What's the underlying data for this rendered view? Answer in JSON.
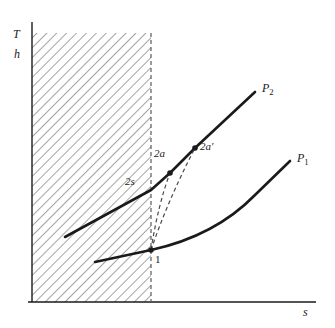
{
  "figure": {
    "title_visible": false,
    "background_color": "#ffffff",
    "line_color": "#1a1a1a",
    "hatch_color": "#555555",
    "dashed_color": "#666666"
  },
  "axes": {
    "y_label_top": "T",
    "y_label_bottom": "h",
    "x_label": "s",
    "x_axis": {
      "x_start": 28,
      "x_end": 316,
      "y": 302
    },
    "y_axis": {
      "x": 32,
      "y_start": 22,
      "y_end": 302
    }
  },
  "saturation_boundary": {
    "name": "vertical-dashed-boundary",
    "x": 151,
    "y_top": 33,
    "y_bottom": 302
  },
  "hatched_region": {
    "name": "two-phase-hatched-region",
    "x": 32,
    "y": 33,
    "width": 119,
    "height": 269,
    "hatch_angle_deg": 45
  },
  "curves": [
    {
      "name": "isobar-p2",
      "label": "P",
      "label_sub": "2",
      "label_x": 262,
      "label_y": 82,
      "stroke_width": 2.6,
      "path": "M 65,237 L 151,190 L 170,173 L 195,148 L 255,92"
    },
    {
      "name": "isobar-p1",
      "label": "P",
      "label_sub": "1",
      "label_x": 297,
      "label_y": 152,
      "stroke_width": 2.6,
      "path": "M 95,262 L 151,250 Q 215,236 255,195 L 290,161"
    }
  ],
  "process_lines": [
    {
      "name": "dashed-process-1-to-2a",
      "path": "M 151,250 Q 158,205 170,173",
      "style": "dashed"
    },
    {
      "name": "dashed-process-1-to-2aprime",
      "path": "M 151,250 Q 168,200 195,148",
      "style": "dashed"
    }
  ],
  "points": [
    {
      "name": "state-point-1",
      "label": "1",
      "italic": false,
      "x": 151,
      "y": 250,
      "marker": true,
      "label_x": 155,
      "label_y": 255
    },
    {
      "name": "state-point-2s",
      "label": "2s",
      "italic": true,
      "x": 151,
      "y": 190,
      "marker": false,
      "label_x": 126,
      "label_y": 177
    },
    {
      "name": "state-point-2a",
      "label": "2a",
      "italic": true,
      "x": 170,
      "y": 173,
      "marker": true,
      "label_x": 155,
      "label_y": 150
    },
    {
      "name": "state-point-2ap",
      "label": "2a'",
      "italic": true,
      "x": 195,
      "y": 148,
      "marker": true,
      "label_x": 201,
      "label_y": 143
    }
  ]
}
